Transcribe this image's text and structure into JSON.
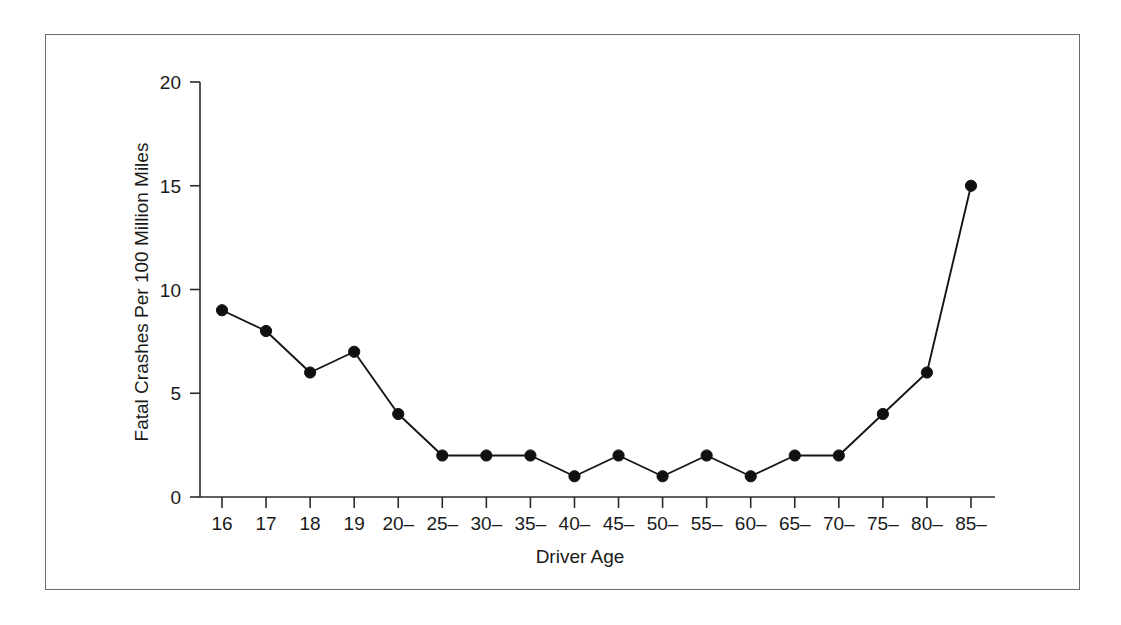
{
  "chart_data": {
    "type": "line",
    "title": "",
    "subtitle": "",
    "xlabel": "Driver Age",
    "ylabel": "Fatal Crashes Per 100 Million Miles",
    "categories": [
      "16",
      "17",
      "18",
      "19",
      "20–",
      "25–",
      "30–",
      "35–",
      "40–",
      "45–",
      "50–",
      "55–",
      "60–",
      "65–",
      "70–",
      "75–",
      "80–",
      "85–"
    ],
    "values": [
      9,
      8,
      6,
      7,
      4,
      2,
      2,
      2,
      1,
      2,
      1,
      2,
      1,
      2,
      2,
      4,
      6,
      15
    ],
    "ylim": [
      0,
      20
    ],
    "yticks": [
      0,
      5,
      10,
      15,
      20
    ],
    "ytick_labels": [
      "0",
      "5",
      "10",
      "15",
      "20"
    ],
    "grid": false,
    "legend": false,
    "legend_position": "none",
    "series": [
      {
        "name": "Fatal Crashes Per 100 Million Miles",
        "marker": "filled-circle",
        "color": "#101010",
        "values": [
          9,
          8,
          6,
          7,
          4,
          2,
          2,
          2,
          1,
          2,
          1,
          2,
          1,
          2,
          2,
          4,
          6,
          15
        ]
      }
    ],
    "colors": {
      "line": "#101010",
      "marker": "#101010",
      "axis": "#2b2b2b",
      "text": "#1a1a1a",
      "frame": "#6b6b6b",
      "background": "#ffffff"
    }
  },
  "figure": {
    "frame_label": "chart-border"
  }
}
